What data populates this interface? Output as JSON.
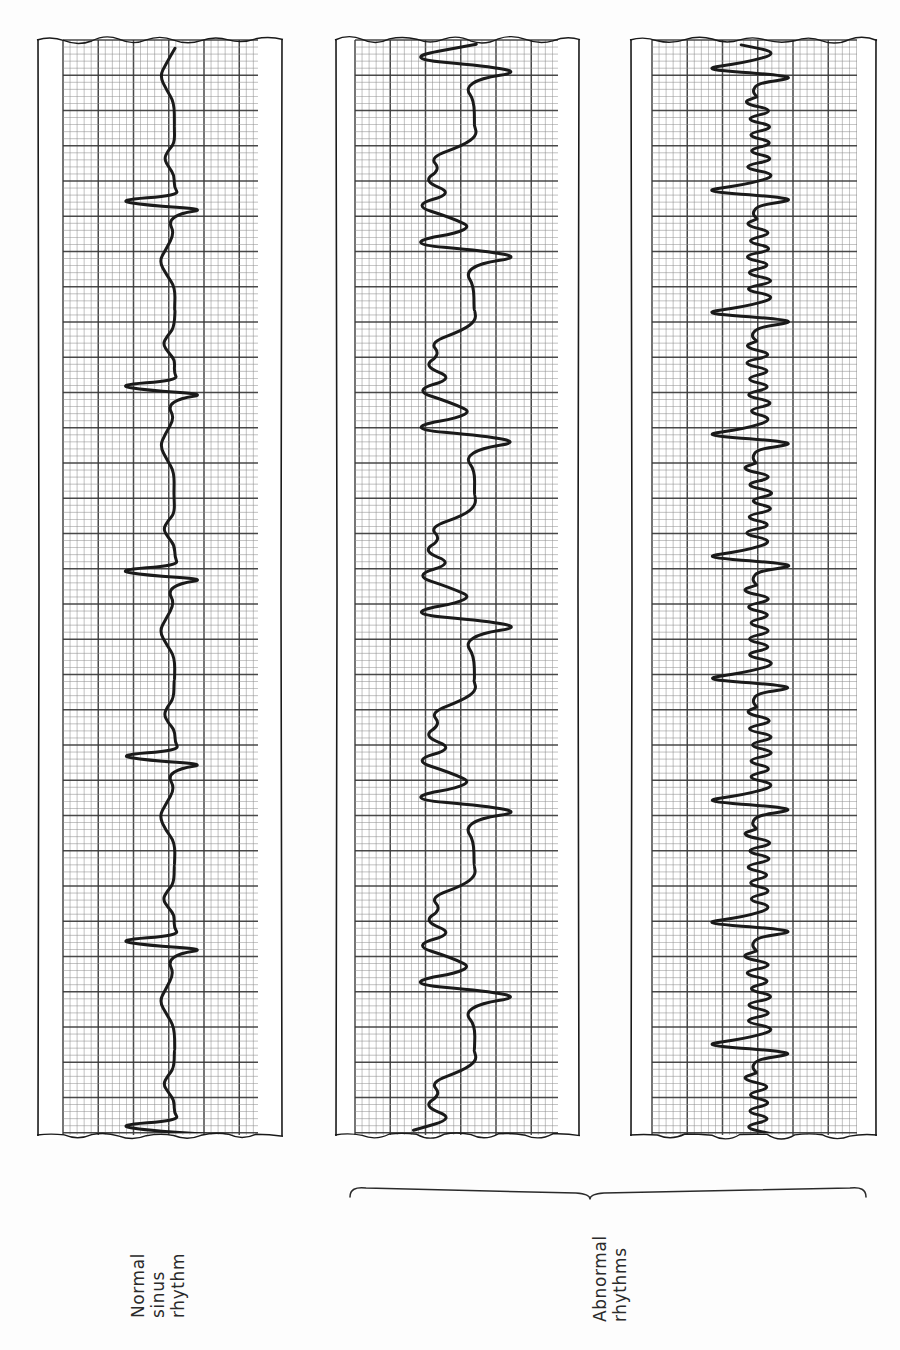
{
  "figure": {
    "background_color": "#fdfdfd",
    "ink_color": "#1a1a1a",
    "grid_minor_color": "#8f8f8f",
    "grid_major_color": "#3a3a3a",
    "orientation_note": "ECG strips printed vertically; labels rotated 90 degrees counter-clockwise"
  },
  "labels": {
    "normal": {
      "line1": "Normal",
      "line2": "sinus",
      "line3": "rhythm"
    },
    "abnormal": {
      "line1": "Abnormal",
      "line2": "rhythms"
    }
  },
  "strips": [
    {
      "id": "strip-normal-sinus",
      "name": "normal-sinus-rhythm-strip",
      "label_key": "normal",
      "x": 37,
      "y": 36,
      "width": 246,
      "height": 1103,
      "grid_left": 63,
      "grid_right": 258,
      "beat_count": 6,
      "rhythm_type": "normal sinus rhythm"
    },
    {
      "id": "strip-abnormal-wide",
      "name": "abnormal-wide-complex-strip",
      "label_key": "abnormal",
      "x": 335,
      "y": 36,
      "width": 245,
      "height": 1103,
      "grid_left": 355,
      "grid_right": 558,
      "beat_count": 6,
      "rhythm_type": "abnormal wide-complex rhythm"
    },
    {
      "id": "strip-abnormal-rapid",
      "name": "abnormal-rapid-oscillation-strip",
      "label_key": "abnormal",
      "x": 630,
      "y": 36,
      "width": 247,
      "height": 1103,
      "grid_left": 652,
      "grid_right": 857,
      "beat_count": 9,
      "rhythm_type": "abnormal rapid oscillating rhythm"
    }
  ],
  "brace": {
    "name": "abnormal-rhythms-brace",
    "x_start": 350,
    "x_end": 866,
    "x_center": 590,
    "y": 1186,
    "spans_strips": [
      "strip-abnormal-wide",
      "strip-abnormal-rapid"
    ]
  },
  "chart_data": {
    "type": "line",
    "title": "",
    "subtitle": "",
    "xlabel": "",
    "ylabel": "",
    "grid": true,
    "legend_position": "none",
    "series": [
      {
        "name": "Normal sinus rhythm",
        "strip": "strip-normal-sinus",
        "beats": 6,
        "beat_spacing_px": 185,
        "qrs_amplitude_px": 95,
        "t_wave_amplitude_px": 18,
        "morphology": "narrow QRS, upright T wave, regular R-R interval"
      },
      {
        "name": "Abnormal rhythm A",
        "strip": "strip-abnormal-wide",
        "beats": 6,
        "beat_spacing_px": 185,
        "qrs_amplitude_px": 112,
        "t_wave_amplitude_px": 42,
        "morphology": "wide bizarre complexes with large deflections, broad slurred waves"
      },
      {
        "name": "Abnormal rhythm B",
        "strip": "strip-abnormal-rapid",
        "beats": 9,
        "beat_spacing_px": 122,
        "qrs_amplitude_px": 100,
        "t_wave_amplitude_px": 30,
        "morphology": "rapid sawtooth oscillations between sharp tall spikes"
      }
    ]
  }
}
